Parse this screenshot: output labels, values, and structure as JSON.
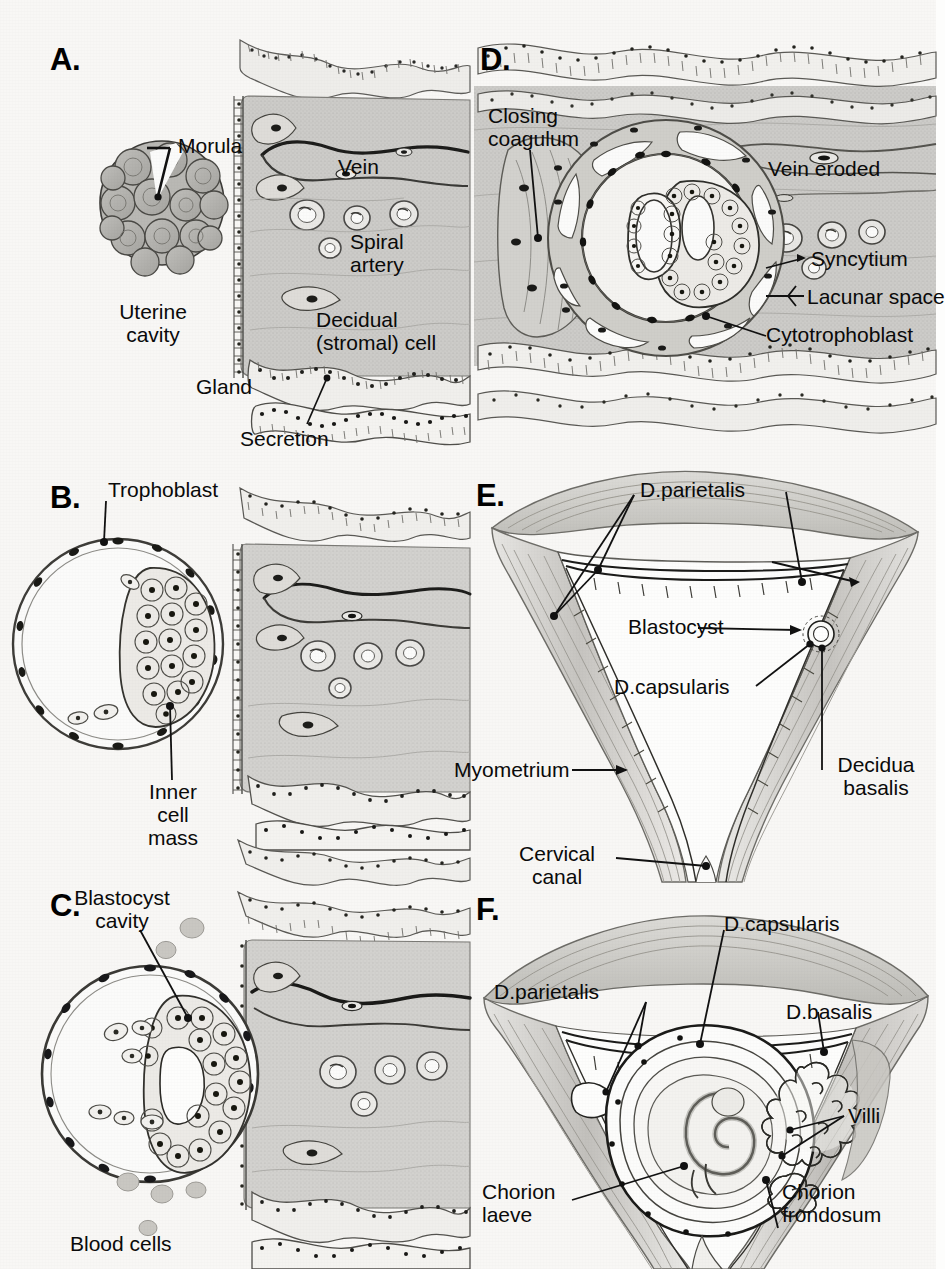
{
  "figure": {
    "background": "#f8f7f5",
    "ink": "#111111",
    "tissue_gray": "#c9c8c6",
    "tissue_light": "#e4e3e0",
    "muscle_gray": "#cfcdc9"
  },
  "panels": [
    {
      "id": "A",
      "letter": "A.",
      "labels": [
        {
          "name": "morula",
          "text": "Morula"
        },
        {
          "name": "uterine-cavity",
          "text": "Uterine\ncavity"
        },
        {
          "name": "vein",
          "text": "Vein"
        },
        {
          "name": "spiral-artery",
          "text": "Spiral\nartery"
        },
        {
          "name": "decidual-cell",
          "text": "Decidual\n(stromal) cell"
        },
        {
          "name": "gland",
          "text": "Gland"
        },
        {
          "name": "secretion",
          "text": "Secretion"
        }
      ]
    },
    {
      "id": "B",
      "letter": "B.",
      "labels": [
        {
          "name": "trophoblast",
          "text": "Trophoblast"
        },
        {
          "name": "inner-cell-mass",
          "text": "Inner\ncell\nmass"
        }
      ]
    },
    {
      "id": "C",
      "letter": "C.",
      "labels": [
        {
          "name": "blastocyst-cavity",
          "text": "Blastocyst\ncavity"
        },
        {
          "name": "blood-cells",
          "text": "Blood cells"
        }
      ]
    },
    {
      "id": "D",
      "letter": "D.",
      "labels": [
        {
          "name": "closing-coagulum",
          "text": "Closing\ncoagulum"
        },
        {
          "name": "vein-eroded",
          "text": "Vein eroded"
        },
        {
          "name": "syncytium",
          "text": "Syncytium"
        },
        {
          "name": "lacunar-space",
          "text": "Lacunar space"
        },
        {
          "name": "cytotrophoblast",
          "text": "Cytotrophoblast"
        }
      ]
    },
    {
      "id": "E",
      "letter": "E.",
      "labels": [
        {
          "name": "d-parietalis",
          "text": "D.parietalis"
        },
        {
          "name": "blastocyst",
          "text": "Blastocyst"
        },
        {
          "name": "d-capsularis",
          "text": "D.capsularis"
        },
        {
          "name": "decidua-basalis",
          "text": "Decidua\nbasalis"
        },
        {
          "name": "myometrium",
          "text": "Myometrium"
        },
        {
          "name": "cervical-canal",
          "text": "Cervical\ncanal"
        }
      ]
    },
    {
      "id": "F",
      "letter": "F.",
      "labels": [
        {
          "name": "d-capsularis",
          "text": "D.capsularis"
        },
        {
          "name": "d-parietalis",
          "text": "D.parietalis"
        },
        {
          "name": "d-basalis",
          "text": "D.basalis"
        },
        {
          "name": "villi",
          "text": "Villi"
        },
        {
          "name": "chorion-laeve",
          "text": "Chorion\nlaeve"
        },
        {
          "name": "chorion-frondosum",
          "text": "Chorion\nfrondosum"
        }
      ]
    }
  ]
}
